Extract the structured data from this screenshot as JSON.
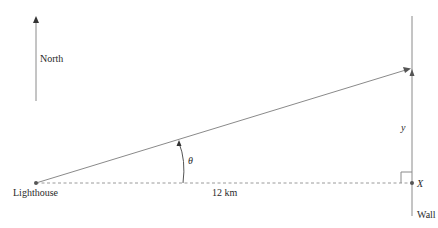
{
  "diagram": {
    "north_label": "North",
    "lighthouse_label": "Lighthouse",
    "distance_label": "12 km",
    "angle_label": "θ",
    "y_label": "y",
    "point_label": "X",
    "wall_label": "Wall"
  },
  "colors": {
    "line": "#8a8a8a",
    "dashed": "#9a9a9a",
    "text": "#2a2a2a",
    "point": "#555555"
  }
}
